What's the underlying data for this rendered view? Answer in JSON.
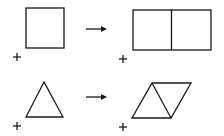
{
  "diagram": {
    "rows": [
      {
        "from": "square",
        "to": "two-squares-rectangle",
        "arrow": "right-arrow"
      },
      {
        "from": "triangle",
        "to": "parallelogram-two-triangles",
        "arrow": "right-arrow"
      }
    ],
    "stroke_color": "#1a1a1a",
    "background": "#ffffff"
  }
}
